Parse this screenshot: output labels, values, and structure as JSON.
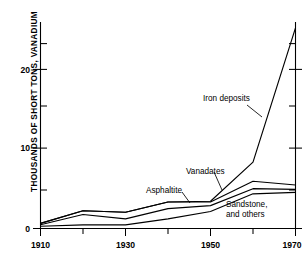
{
  "chart_data": {
    "type": "line",
    "title": "",
    "subtitle": "",
    "xlabel": "",
    "ylabel": "THOUSANDS OF SHORT TONS, VANADIUM",
    "xlim": [
      1910,
      1970
    ],
    "ylim": [
      0,
      28
    ],
    "grid": false,
    "legend_position": "inline-annotations",
    "x": [
      1910,
      1920,
      1930,
      1940,
      1950,
      1960,
      1970
    ],
    "x_tick_labels": [
      "1910",
      "1930",
      "1950",
      "1970"
    ],
    "x_major_ticks": [
      1910,
      1930,
      1950,
      1970
    ],
    "x_minor_ticks": [
      1920,
      1940,
      1960
    ],
    "y_tick_labels": [
      "0",
      "10",
      "20"
    ],
    "y_major_ticks": [
      0,
      10,
      20
    ],
    "y_minor_ticks": [
      5,
      15,
      25
    ],
    "stacking": "cumulative",
    "series": [
      {
        "name": "Sandstone, and others",
        "values": [
          0.3,
          0.5,
          0.5,
          1.3,
          2.3,
          4.7,
          4.9
        ]
      },
      {
        "name": "Asphaltite",
        "values": [
          0.5,
          1.9,
          1.3,
          2.7,
          3.1,
          5.4,
          5.3
        ]
      },
      {
        "name": "Vanadates",
        "values": [
          0.7,
          2.4,
          2.2,
          3.6,
          3.6,
          6.4,
          5.9
        ]
      },
      {
        "name": "Iron deposits",
        "values": [
          0.7,
          2.4,
          2.2,
          3.6,
          3.7,
          9.0,
          27.2
        ]
      }
    ],
    "annotations": [
      {
        "text": "Iron deposits",
        "x": 1952,
        "y": 17.4
      },
      {
        "text": "Vanadates",
        "x": 1945,
        "y": 9.1
      },
      {
        "text": "Asphaltite",
        "x": 1936,
        "y": 6.0
      },
      {
        "text": "Sandstone,",
        "x": 1955,
        "y": 3.6
      },
      {
        "text": "and others",
        "x": 1955,
        "y": 2.4
      }
    ]
  },
  "axes": {
    "y_label_text": "THOUSANDS OF SHORT TONS, VANADIUM",
    "y_ticks": [
      {
        "label": "20",
        "value": 20
      },
      {
        "label": "10",
        "value": 10
      },
      {
        "label": "0",
        "value": 0
      }
    ],
    "x_ticks": [
      {
        "label": "1910",
        "value": 1910
      },
      {
        "label": "1930",
        "value": 1930
      },
      {
        "label": "1950",
        "value": 1950
      },
      {
        "label": "1970",
        "value": 1970
      }
    ]
  },
  "labels": {
    "iron_deposits": "Iron deposits",
    "vanadates": "Vanadates",
    "asphaltite": "Asphaltite",
    "sandstone_line1": "Sandstone,",
    "sandstone_line2": "and others"
  }
}
